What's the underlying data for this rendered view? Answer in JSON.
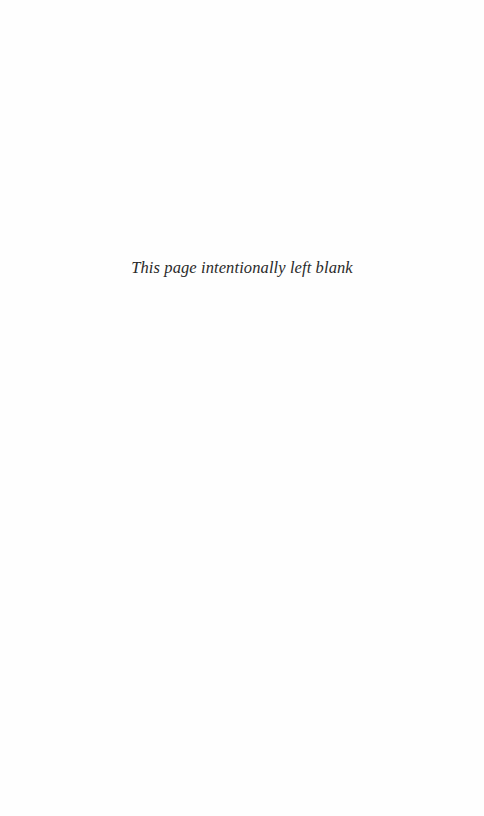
{
  "page": {
    "notice": "This page intentionally left blank"
  }
}
